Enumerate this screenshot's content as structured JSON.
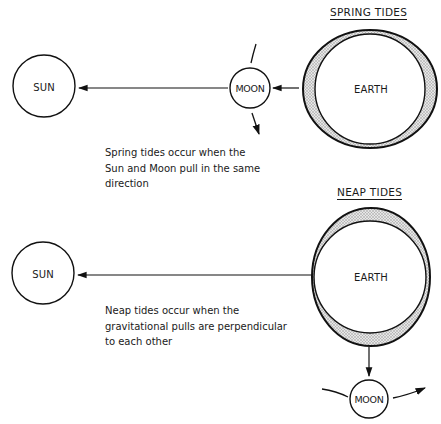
{
  "spring": {
    "title": "SPRING TIDES",
    "sun_label": "SUN",
    "moon_label": "MOON",
    "earth_label": "EARTH",
    "caption_lines": [
      "Spring tides occur when the",
      "Sun and Moon pull in the same",
      "direction"
    ]
  },
  "neap": {
    "title": "NEAP TIDES",
    "sun_label": "SUN",
    "moon_label": "MOON",
    "earth_label": "EARTH",
    "caption_lines": [
      "Neap tides occur when the",
      "gravitational pulls are perpendicular",
      "to each other"
    ]
  },
  "colors": {
    "stroke": "#111111",
    "bulge_fill": "#c8c8c8",
    "background": "#ffffff"
  }
}
